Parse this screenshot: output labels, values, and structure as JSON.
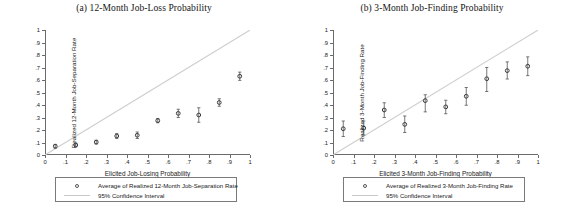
{
  "figure": {
    "panels": [
      {
        "id": "panel-a",
        "title": "(a) 12-Month Job-Loss Probability",
        "chart_data": {
          "type": "scatter",
          "title": "(a) 12-Month Job-Loss Probability",
          "xlabel": "Elicited Job-Losing Probability",
          "ylabel": "Realized 12-Month Job-Separation Rate",
          "xlim": [
            0,
            1
          ],
          "ylim": [
            0,
            1
          ],
          "grid": false,
          "xticks": [
            "0",
            ".1",
            ".2",
            ".3",
            ".4",
            ".5",
            ".6",
            ".7",
            ".8",
            ".9",
            "1"
          ],
          "xtick_values": [
            0,
            0.1,
            0.2,
            0.3,
            0.4,
            0.5,
            0.6,
            0.7,
            0.8,
            0.9,
            1
          ],
          "yticks": [
            "0",
            ".1",
            ".2",
            ".3",
            ".4",
            ".5",
            ".6",
            ".7",
            ".8",
            ".9",
            "1"
          ],
          "ytick_values": [
            0,
            0.1,
            0.2,
            0.3,
            0.4,
            0.5,
            0.6,
            0.7,
            0.8,
            0.9,
            1
          ],
          "x": [
            0.05,
            0.15,
            0.25,
            0.35,
            0.45,
            0.55,
            0.65,
            0.75,
            0.85,
            0.95
          ],
          "y": [
            0.07,
            0.08,
            0.103,
            0.152,
            0.158,
            0.275,
            0.333,
            0.32,
            0.42,
            0.63
          ],
          "ci_low": [
            0.055,
            0.065,
            0.088,
            0.133,
            0.132,
            0.258,
            0.3,
            0.262,
            0.39,
            0.597
          ],
          "ci_high": [
            0.085,
            0.095,
            0.118,
            0.171,
            0.184,
            0.292,
            0.366,
            0.378,
            0.45,
            0.663
          ],
          "reference_line": {
            "type": "45-degree",
            "from": [
              0,
              0
            ],
            "to": [
              1,
              1
            ]
          },
          "legend_position": "below",
          "legend": [
            {
              "key": "circle",
              "label": "Average of Realized 12-Month Job-Separation Rate"
            },
            {
              "key": "line",
              "label": "95% Confidence Interval"
            }
          ]
        }
      },
      {
        "id": "panel-b",
        "title": "(b) 3-Month Job-Finding Probability",
        "chart_data": {
          "type": "scatter",
          "title": "(b) 3-Month Job-Finding Probability",
          "xlabel": "Elicited 3-Month Job-Finding Probability",
          "ylabel": "Realized 3-Month Job-Finding Rate",
          "xlim": [
            0,
            1
          ],
          "ylim": [
            0,
            1
          ],
          "grid": false,
          "xticks": [
            "0",
            ".1",
            ".2",
            ".3",
            ".4",
            ".5",
            ".6",
            ".7",
            ".8",
            ".9",
            "1"
          ],
          "xtick_values": [
            0,
            0.1,
            0.2,
            0.3,
            0.4,
            0.5,
            0.6,
            0.7,
            0.8,
            0.9,
            1
          ],
          "yticks": [
            "0",
            ".1",
            ".2",
            ".3",
            ".4",
            ".5",
            ".6",
            ".7",
            ".8",
            ".9",
            "1"
          ],
          "ytick_values": [
            0,
            0.1,
            0.2,
            0.3,
            0.4,
            0.5,
            0.6,
            0.7,
            0.8,
            0.9,
            1
          ],
          "x": [
            0.05,
            0.15,
            0.25,
            0.35,
            0.45,
            0.55,
            0.65,
            0.75,
            0.85,
            0.95
          ],
          "y": [
            0.21,
            0.215,
            0.36,
            0.245,
            0.435,
            0.385,
            0.47,
            0.61,
            0.675,
            0.71
          ],
          "ci_low": [
            0.148,
            0.16,
            0.3,
            0.18,
            0.345,
            0.33,
            0.398,
            0.508,
            0.608,
            0.635
          ],
          "ci_high": [
            0.272,
            0.272,
            0.418,
            0.312,
            0.482,
            0.438,
            0.54,
            0.7,
            0.745,
            0.785
          ],
          "reference_line": {
            "type": "45-degree",
            "from": [
              0,
              0
            ],
            "to": [
              1,
              1
            ]
          },
          "legend_position": "below",
          "legend": [
            {
              "key": "circle",
              "label": "Average of Realized 3-Month Job-Finding Rate"
            },
            {
              "key": "line",
              "label": "95% Confidence Interval"
            }
          ]
        }
      }
    ]
  },
  "colors": {
    "marker": "#3c3c3c",
    "ci": "#555555",
    "reference_line": "#cfcfcf",
    "axis": "#6b6b6b",
    "text": "#1a1a1a"
  }
}
